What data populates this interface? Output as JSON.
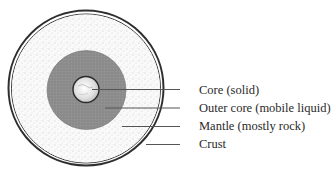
{
  "diagram": {
    "type": "cross-section",
    "layers": [
      {
        "key": "core",
        "label": "Core (solid)",
        "fill": "#e6e6e6",
        "radius": 13
      },
      {
        "key": "outer_core",
        "label": "Outer core (mobile liquid)",
        "fill": "#8c8c8c",
        "radius": 39
      },
      {
        "key": "mantle",
        "label": "Mantle (mostly rock)",
        "fill": "#f4f4f4",
        "radius": 74
      },
      {
        "key": "crust",
        "label": "Crust",
        "fill": "#ffffff",
        "radius": 78
      }
    ],
    "colors": {
      "outline": "#333333",
      "leader_line": "#555555",
      "text": "#2a2a2a"
    }
  }
}
